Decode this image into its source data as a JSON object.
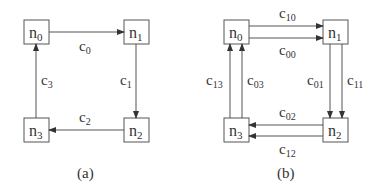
{
  "diagrams": [
    {
      "caption": "(a)",
      "nodes": {
        "n0": "n",
        "n0_sub": "0",
        "n1": "n",
        "n1_sub": "1",
        "n2": "n",
        "n2_sub": "2",
        "n3": "n",
        "n3_sub": "3"
      },
      "edges": [
        {
          "label": "c",
          "sub": "0",
          "from": "n0",
          "to": "n1"
        },
        {
          "label": "c",
          "sub": "1",
          "from": "n1",
          "to": "n2"
        },
        {
          "label": "c",
          "sub": "2",
          "from": "n2",
          "to": "n3"
        },
        {
          "label": "c",
          "sub": "3",
          "from": "n3",
          "to": "n0"
        }
      ]
    },
    {
      "caption": "(b)",
      "nodes": {
        "n0": "n",
        "n0_sub": "0",
        "n1": "n",
        "n1_sub": "1",
        "n2": "n",
        "n2_sub": "2",
        "n3": "n",
        "n3_sub": "3"
      },
      "edges": [
        {
          "label": "c",
          "sub": "10",
          "from": "n0",
          "to": "n1"
        },
        {
          "label": "c",
          "sub": "00",
          "from": "n0",
          "to": "n1"
        },
        {
          "label": "c",
          "sub": "01",
          "from": "n1",
          "to": "n2"
        },
        {
          "label": "c",
          "sub": "11",
          "from": "n1",
          "to": "n2"
        },
        {
          "label": "c",
          "sub": "02",
          "from": "n2",
          "to": "n3"
        },
        {
          "label": "c",
          "sub": "12",
          "from": "n2",
          "to": "n3"
        },
        {
          "label": "c",
          "sub": "13",
          "from": "n3",
          "to": "n0"
        },
        {
          "label": "c",
          "sub": "03",
          "from": "n3",
          "to": "n0"
        }
      ]
    }
  ]
}
